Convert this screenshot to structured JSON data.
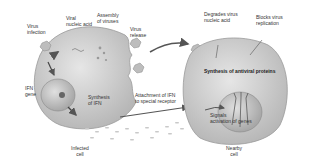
{
  "diagram": {
    "infected_cell": {
      "caption": [
        "Infected",
        "cell"
      ],
      "labels": {
        "virus_infection": [
          "Virus",
          "infection"
        ],
        "viral_nucleic_acid": [
          "Viral",
          "nucleic acid"
        ],
        "assembly_of_viruses": [
          "Assembly",
          "of viruses"
        ],
        "virus_release": [
          "Virus",
          "release"
        ],
        "ifn_gene": [
          "IFN",
          "gene"
        ],
        "synthesis_of_ifn": [
          "Synthesis",
          "of IFN"
        ]
      }
    },
    "nearby_cell": {
      "caption": [
        "Nearby",
        "cell"
      ],
      "labels": {
        "degrades_virus_nucleic_acid": [
          "Degrades virus",
          "nucleic acid"
        ],
        "blocks_virus_replication": [
          "Blocks virus",
          "replication"
        ],
        "synthesis_of_antiviral_proteins": "Synthesis of antiviral proteins",
        "signals_activation_of_genes": [
          "Signals",
          "activation of genes"
        ]
      }
    },
    "between_cells": {
      "attachment_of_ifn": [
        "Attachment of IFN",
        "to special receptor"
      ]
    },
    "colors": {
      "cell_fill": "#cfcfcf",
      "cell_edge": "#9a9a9a",
      "nucleus_fill": "#b8b8b8",
      "virus_fill": "#bdbdbd",
      "arrow": "#555555",
      "background": "#ffffff"
    }
  }
}
